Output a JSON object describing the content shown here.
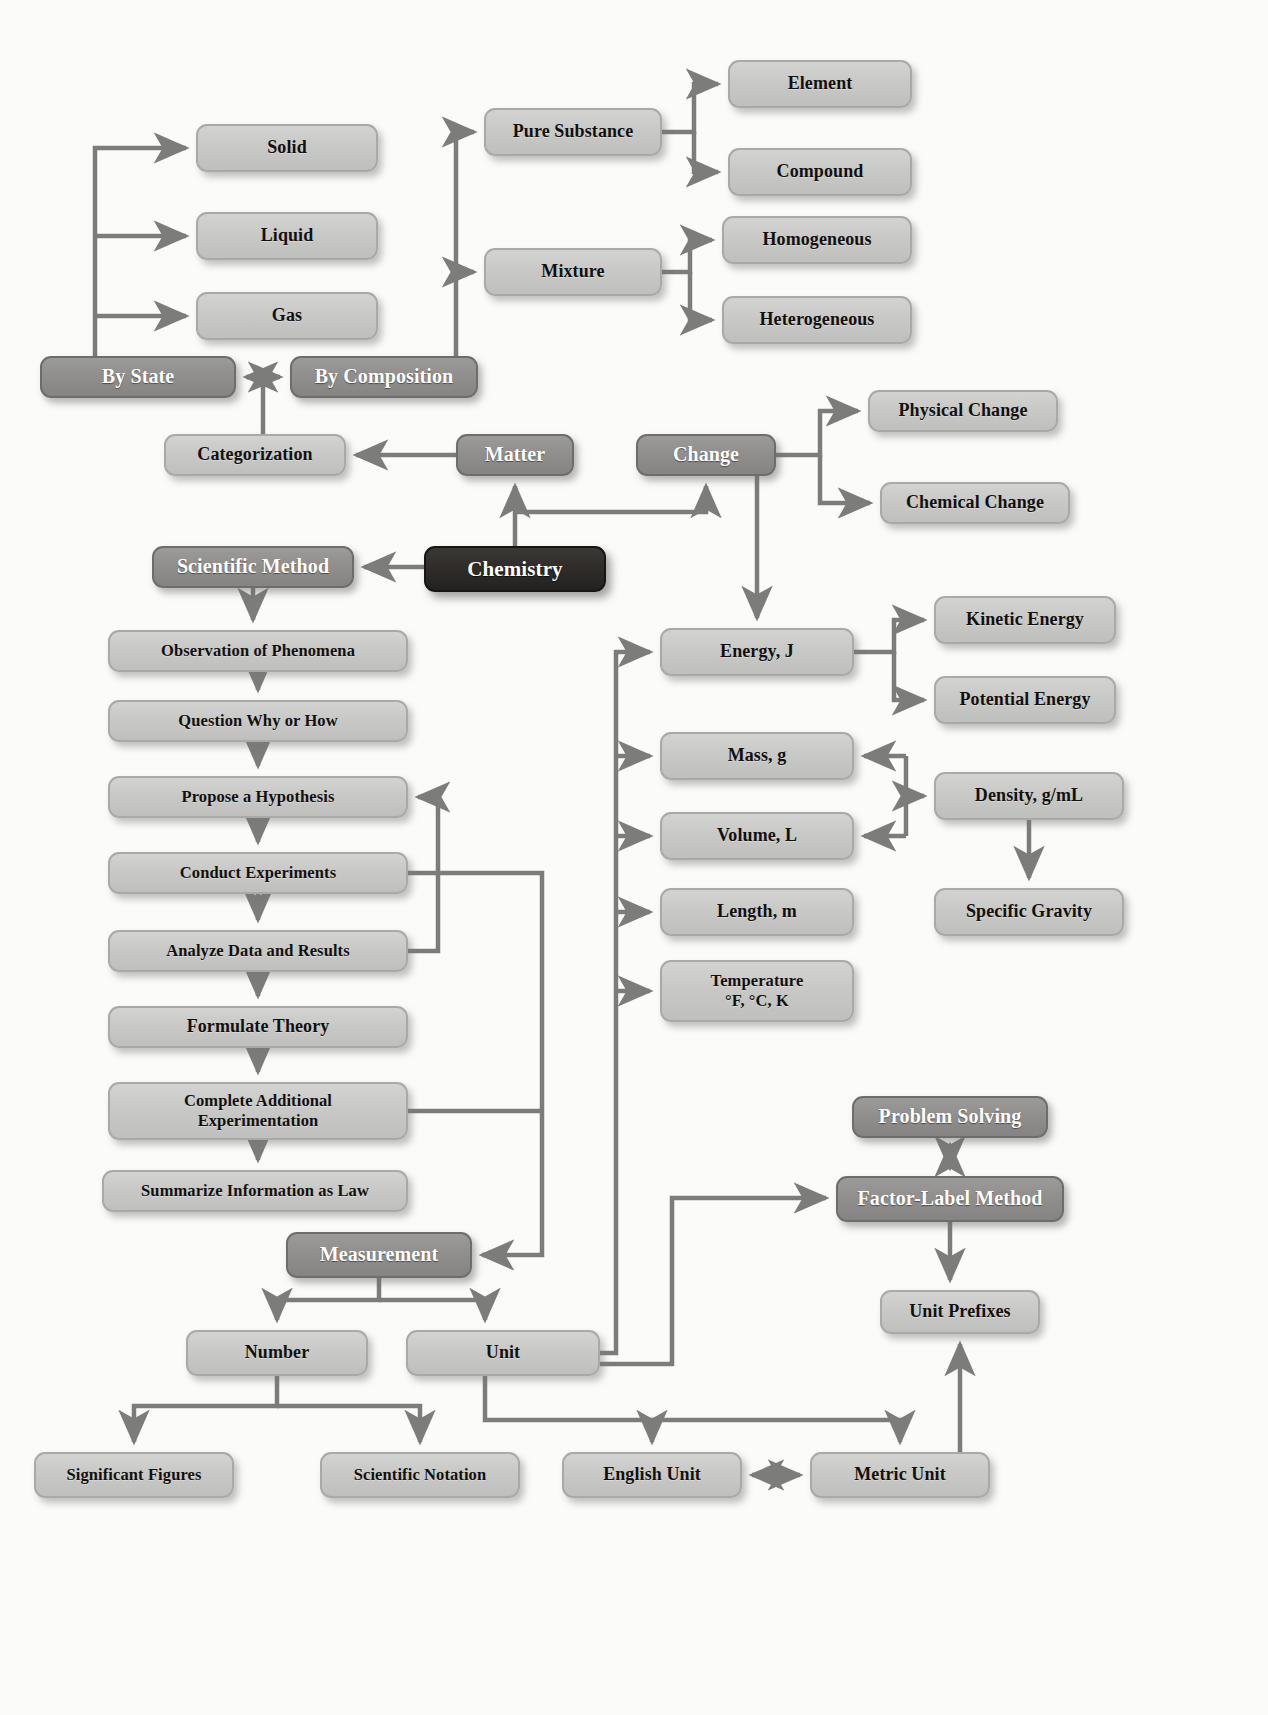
{
  "diagram": {
    "colors": {
      "light_node_fill": "#c9c9c7",
      "light_node_border": "#a9a9a7",
      "mid_node_fill": "#918f8d",
      "mid_node_border": "#6f6d6b",
      "dark_node_fill": "#2e2b28",
      "dark_node_border": "#171614",
      "edge_stroke": "#7c7c7a",
      "background": "#fbfbfa",
      "light_text": "#12100e",
      "dark_text": "#ffffff"
    },
    "nodes": [
      {
        "id": "solid",
        "label": "Solid",
        "style": "light",
        "x": 196,
        "y": 124,
        "w": 182,
        "h": 48
      },
      {
        "id": "liquid",
        "label": "Liquid",
        "style": "light",
        "x": 196,
        "y": 212,
        "w": 182,
        "h": 48
      },
      {
        "id": "gas",
        "label": "Gas",
        "style": "light",
        "x": 196,
        "y": 292,
        "w": 182,
        "h": 48
      },
      {
        "id": "pure_substance",
        "label": "Pure Substance",
        "style": "light",
        "x": 484,
        "y": 108,
        "w": 178,
        "h": 48
      },
      {
        "id": "mixture",
        "label": "Mixture",
        "style": "light",
        "x": 484,
        "y": 248,
        "w": 178,
        "h": 48
      },
      {
        "id": "element",
        "label": "Element",
        "style": "light",
        "x": 728,
        "y": 60,
        "w": 184,
        "h": 48
      },
      {
        "id": "compound",
        "label": "Compound",
        "style": "light",
        "x": 728,
        "y": 148,
        "w": 184,
        "h": 48
      },
      {
        "id": "homogeneous",
        "label": "Homogeneous",
        "style": "light",
        "x": 722,
        "y": 216,
        "w": 190,
        "h": 48
      },
      {
        "id": "heterogeneous",
        "label": "Heterogeneous",
        "style": "light",
        "x": 722,
        "y": 296,
        "w": 190,
        "h": 48
      },
      {
        "id": "by_state",
        "label": "By State",
        "style": "mid",
        "x": 40,
        "y": 356,
        "w": 196,
        "h": 42
      },
      {
        "id": "by_composition",
        "label": "By Composition",
        "style": "mid",
        "x": 290,
        "y": 356,
        "w": 188,
        "h": 42
      },
      {
        "id": "categorization",
        "label": "Categorization",
        "style": "light",
        "x": 164,
        "y": 434,
        "w": 182,
        "h": 42
      },
      {
        "id": "matter",
        "label": "Matter",
        "style": "mid",
        "x": 456,
        "y": 434,
        "w": 118,
        "h": 42
      },
      {
        "id": "change",
        "label": "Change",
        "style": "mid",
        "x": 636,
        "y": 434,
        "w": 140,
        "h": 42
      },
      {
        "id": "physical_change",
        "label": "Physical Change",
        "style": "light",
        "x": 868,
        "y": 390,
        "w": 190,
        "h": 42
      },
      {
        "id": "chemical_change",
        "label": "Chemical Change",
        "style": "light",
        "x": 880,
        "y": 482,
        "w": 190,
        "h": 42
      },
      {
        "id": "scientific_method",
        "label": "Scientific Method",
        "style": "mid",
        "x": 152,
        "y": 546,
        "w": 202,
        "h": 42
      },
      {
        "id": "chemistry",
        "label": "Chemistry",
        "style": "dark",
        "x": 424,
        "y": 546,
        "w": 182,
        "h": 46
      },
      {
        "id": "observation",
        "label": "Observation of Phenomena",
        "style": "light",
        "x": 108,
        "y": 630,
        "w": 300,
        "h": 42
      },
      {
        "id": "question",
        "label": "Question Why or How",
        "style": "light",
        "x": 108,
        "y": 700,
        "w": 300,
        "h": 42
      },
      {
        "id": "hypothesis",
        "label": "Propose a Hypothesis",
        "style": "light",
        "x": 108,
        "y": 776,
        "w": 300,
        "h": 42
      },
      {
        "id": "experiments",
        "label": "Conduct Experiments",
        "style": "light",
        "x": 108,
        "y": 852,
        "w": 300,
        "h": 42
      },
      {
        "id": "analyze",
        "label": "Analyze Data and Results",
        "style": "light",
        "x": 108,
        "y": 930,
        "w": 300,
        "h": 42
      },
      {
        "id": "theory",
        "label": "Formulate Theory",
        "style": "light",
        "x": 108,
        "y": 1006,
        "w": 300,
        "h": 42
      },
      {
        "id": "additional_exp",
        "label": "Complete Additional\nExperimentation",
        "style": "light",
        "x": 108,
        "y": 1082,
        "w": 300,
        "h": 58
      },
      {
        "id": "law",
        "label": "Summarize Information as Law",
        "style": "light",
        "x": 102,
        "y": 1170,
        "w": 306,
        "h": 42
      },
      {
        "id": "energy",
        "label": "Energy, J",
        "style": "light",
        "x": 660,
        "y": 628,
        "w": 194,
        "h": 48
      },
      {
        "id": "kinetic",
        "label": "Kinetic Energy",
        "style": "light",
        "x": 934,
        "y": 596,
        "w": 182,
        "h": 48
      },
      {
        "id": "potential",
        "label": "Potential Energy",
        "style": "light",
        "x": 934,
        "y": 676,
        "w": 182,
        "h": 48
      },
      {
        "id": "mass",
        "label": "Mass, g",
        "style": "light",
        "x": 660,
        "y": 732,
        "w": 194,
        "h": 48
      },
      {
        "id": "volume",
        "label": "Volume, L",
        "style": "light",
        "x": 660,
        "y": 812,
        "w": 194,
        "h": 48
      },
      {
        "id": "density",
        "label": "Density, g/mL",
        "style": "light",
        "x": 934,
        "y": 772,
        "w": 190,
        "h": 48
      },
      {
        "id": "specific_gravity",
        "label": "Specific Gravity",
        "style": "light",
        "x": 934,
        "y": 888,
        "w": 190,
        "h": 48
      },
      {
        "id": "length",
        "label": "Length, m",
        "style": "light",
        "x": 660,
        "y": 888,
        "w": 194,
        "h": 48
      },
      {
        "id": "temperature",
        "label": "Temperature\n°F, °C, K",
        "style": "light",
        "x": 660,
        "y": 960,
        "w": 194,
        "h": 62
      },
      {
        "id": "problem_solving",
        "label": "Problem Solving",
        "style": "mid",
        "x": 852,
        "y": 1096,
        "w": 196,
        "h": 42
      },
      {
        "id": "factor_label",
        "label": "Factor-Label Method",
        "style": "mid",
        "x": 836,
        "y": 1176,
        "w": 228,
        "h": 46
      },
      {
        "id": "unit_prefixes",
        "label": "Unit Prefixes",
        "style": "light",
        "x": 880,
        "y": 1290,
        "w": 160,
        "h": 44
      },
      {
        "id": "measurement",
        "label": "Measurement",
        "style": "mid",
        "x": 286,
        "y": 1232,
        "w": 186,
        "h": 46
      },
      {
        "id": "number",
        "label": "Number",
        "style": "light",
        "x": 186,
        "y": 1330,
        "w": 182,
        "h": 46
      },
      {
        "id": "unit",
        "label": "Unit",
        "style": "light",
        "x": 406,
        "y": 1330,
        "w": 194,
        "h": 46
      },
      {
        "id": "sig_figs",
        "label": "Significant Figures",
        "style": "light",
        "x": 34,
        "y": 1452,
        "w": 200,
        "h": 46
      },
      {
        "id": "sci_notation",
        "label": "Scientific Notation",
        "style": "light",
        "x": 320,
        "y": 1452,
        "w": 200,
        "h": 46
      },
      {
        "id": "english_unit",
        "label": "English Unit",
        "style": "light",
        "x": 562,
        "y": 1452,
        "w": 180,
        "h": 46
      },
      {
        "id": "metric_unit",
        "label": "Metric Unit",
        "style": "light",
        "x": 810,
        "y": 1452,
        "w": 180,
        "h": 46
      }
    ],
    "edges": [
      {
        "from": "by_state",
        "to": "solid",
        "arrow": "single"
      },
      {
        "from": "by_state",
        "to": "liquid",
        "arrow": "single"
      },
      {
        "from": "by_state",
        "to": "gas",
        "arrow": "single"
      },
      {
        "from": "by_composition",
        "to": "pure_substance",
        "arrow": "single"
      },
      {
        "from": "by_composition",
        "to": "mixture",
        "arrow": "single"
      },
      {
        "from": "pure_substance",
        "to": "element",
        "arrow": "single"
      },
      {
        "from": "pure_substance",
        "to": "compound",
        "arrow": "single"
      },
      {
        "from": "mixture",
        "to": "homogeneous",
        "arrow": "single"
      },
      {
        "from": "mixture",
        "to": "heterogeneous",
        "arrow": "single"
      },
      {
        "from": "by_state",
        "to": "by_composition",
        "arrow": "double"
      },
      {
        "from": "categorization",
        "to": "by_state",
        "arrow": "none"
      },
      {
        "from": "matter",
        "to": "categorization",
        "arrow": "single"
      },
      {
        "from": "chemistry",
        "to": "matter",
        "arrow": "single"
      },
      {
        "from": "chemistry",
        "to": "change",
        "arrow": "single"
      },
      {
        "from": "chemistry",
        "to": "scientific_method",
        "arrow": "single"
      },
      {
        "from": "change",
        "to": "physical_change",
        "arrow": "single"
      },
      {
        "from": "change",
        "to": "chemical_change",
        "arrow": "single"
      },
      {
        "from": "change",
        "to": "energy",
        "arrow": "single"
      },
      {
        "from": "scientific_method",
        "to": "observation",
        "arrow": "single"
      },
      {
        "from": "observation",
        "to": "question",
        "arrow": "single"
      },
      {
        "from": "question",
        "to": "hypothesis",
        "arrow": "single"
      },
      {
        "from": "hypothesis",
        "to": "experiments",
        "arrow": "single"
      },
      {
        "from": "experiments",
        "to": "analyze",
        "arrow": "single"
      },
      {
        "from": "analyze",
        "to": "theory",
        "arrow": "single"
      },
      {
        "from": "theory",
        "to": "additional_exp",
        "arrow": "single"
      },
      {
        "from": "additional_exp",
        "to": "law",
        "arrow": "single"
      },
      {
        "from": "analyze",
        "to": "hypothesis",
        "arrow": "single"
      },
      {
        "from": "experiments",
        "to": "measurement",
        "arrow": "single"
      },
      {
        "from": "additional_exp",
        "to": "measurement",
        "arrow": "single"
      },
      {
        "from": "energy",
        "to": "kinetic",
        "arrow": "single"
      },
      {
        "from": "energy",
        "to": "potential",
        "arrow": "single"
      },
      {
        "from": "density",
        "to": "mass",
        "arrow": "single"
      },
      {
        "from": "density",
        "to": "volume",
        "arrow": "single"
      },
      {
        "from": "density",
        "to": "specific_gravity",
        "arrow": "single"
      },
      {
        "from": "unit",
        "to": "energy",
        "arrow": "single"
      },
      {
        "from": "unit",
        "to": "mass",
        "arrow": "single"
      },
      {
        "from": "unit",
        "to": "volume",
        "arrow": "single"
      },
      {
        "from": "unit",
        "to": "length",
        "arrow": "single"
      },
      {
        "from": "unit",
        "to": "temperature",
        "arrow": "single"
      },
      {
        "from": "problem_solving",
        "to": "factor_label",
        "arrow": "double"
      },
      {
        "from": "factor_label",
        "to": "unit_prefixes",
        "arrow": "single"
      },
      {
        "from": "unit",
        "to": "factor_label",
        "arrow": "single"
      },
      {
        "from": "measurement",
        "to": "number",
        "arrow": "single"
      },
      {
        "from": "measurement",
        "to": "unit",
        "arrow": "single"
      },
      {
        "from": "number",
        "to": "sig_figs",
        "arrow": "single"
      },
      {
        "from": "number",
        "to": "sci_notation",
        "arrow": "single"
      },
      {
        "from": "unit",
        "to": "english_unit",
        "arrow": "single"
      },
      {
        "from": "unit",
        "to": "metric_unit",
        "arrow": "single"
      },
      {
        "from": "english_unit",
        "to": "metric_unit",
        "arrow": "double"
      },
      {
        "from": "metric_unit",
        "to": "unit_prefixes",
        "arrow": "single"
      }
    ]
  }
}
